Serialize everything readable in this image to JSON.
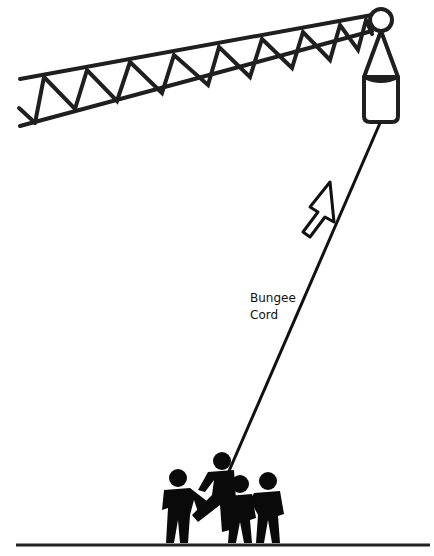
{
  "diagram": {
    "labels": {
      "cord_line1": "Bungee",
      "cord_line2": "Cord"
    },
    "components": [
      "crane-boom",
      "pulley",
      "counterweight",
      "bungee-cord",
      "up-arrow",
      "people",
      "ground"
    ],
    "colors": {
      "line": "#1a1a1a",
      "background": "#ffffff"
    }
  }
}
